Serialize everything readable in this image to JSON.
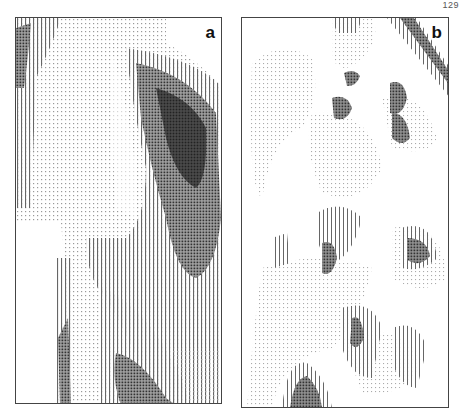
{
  "page": {
    "number": "129"
  },
  "figure": {
    "panels": [
      {
        "label": "a",
        "description": "Dot-density contour map with large dark elongated ridge along right side and dark zone at bottom"
      },
      {
        "label": "b",
        "description": "Dot-density contour map with scattered small dark patches and dark diagonal band at top right"
      }
    ]
  },
  "colors": {
    "ink": "#222222",
    "medium": "#777777",
    "light": "#bbbbbb",
    "background": "#ffffff"
  }
}
